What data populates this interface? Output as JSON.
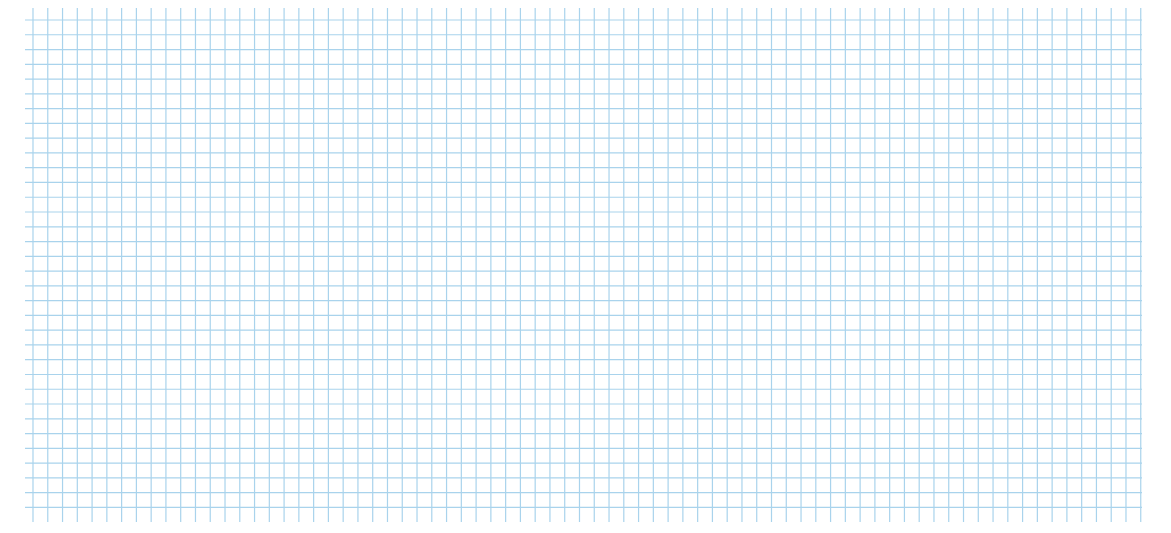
{
  "figure": {
    "background": "#ffffff",
    "grid": {
      "color": "#a9d3ec",
      "x_start": 33,
      "x_end": 1141,
      "y_start": 20,
      "y_end": 519,
      "v_top": 8,
      "h_left": 25,
      "spacing": 14.77
    },
    "circle_fill": "#f9d9d6",
    "circle_stroke": "#1a1a1a"
  },
  "circles": [
    {
      "radius_label": "2.0 cm",
      "area_label": "Area 12.6 cm",
      "area_sup": "2",
      "radius_cm": 2.0,
      "area_cm2": 12.6,
      "cx": 180,
      "cy": 215,
      "rx": 147,
      "ry": 150,
      "arrow_y": 215,
      "radius_text_x": 220,
      "radius_text_y": 208,
      "area_text_x": 112,
      "area_text_y": 287
    },
    {
      "radius_label": "2.4 cm",
      "area_label": "Area 18.1 cm",
      "area_sup": "2",
      "radius_cm": 2.4,
      "area_cm2": 18.1,
      "cx": 551,
      "cy": 290,
      "rx": 177,
      "ry": 181,
      "arrow_y": 292,
      "radius_text_x": 609,
      "radius_text_y": 285,
      "area_text_x": 483,
      "area_text_y": 420
    },
    {
      "radius_label": "1.6 cm",
      "area_label": "Area 8.0 cm",
      "area_sup": "2",
      "radius_cm": 1.6,
      "area_cm2": 8.0,
      "cx": 876,
      "cy": 215,
      "rx": 117,
      "ry": 121,
      "arrow_y": 216,
      "radius_text_x": 901,
      "radius_text_y": 209,
      "area_text_x": 815,
      "area_text_y": 285
    },
    {
      "radius_label": "1.3 cm",
      "area_label": "Area 5.3 cm",
      "area_sup": "2",
      "radius_cm": 1.3,
      "area_cm2": 5.3,
      "cx": 1044,
      "cy": 398,
      "rx": 95,
      "ry": 97,
      "arrow_y": 398,
      "radius_text_x": 1054,
      "radius_text_y": 390,
      "area_text_x": 985,
      "area_text_y": 452
    }
  ]
}
